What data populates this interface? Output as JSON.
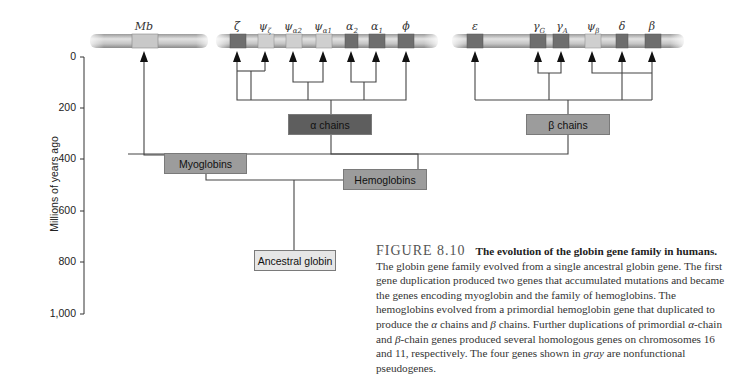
{
  "figure": {
    "number": "FIGURE 8.10",
    "title": "The evolution of the globin gene family in humans.",
    "caption_parts": [
      "The globin gene family evolved from a single ancestral globin gene. The first gene duplication produced two genes that accumulated mutations and became the genes encoding myoglobin and the family of hemoglobins. The hemoglobins evolved from a primordial hemoglobin gene that duplicated to produce the ",
      "α",
      " chains and ",
      "β",
      " chains. Further duplications of primordial ",
      "α",
      "-chain and ",
      "β",
      "-chain genes produced several homologous genes on chromosomes 16 and 11, respectively. The four genes shown in ",
      "gray",
      " are nonfunctional pseudogenes."
    ]
  },
  "axis": {
    "label": "Millions of years ago",
    "ticks": [
      "0",
      "200",
      "400",
      "600",
      "800",
      "1,000"
    ]
  },
  "genes": {
    "myoglobin_chromosome": [
      {
        "symbol": "Mb",
        "sub": ""
      }
    ],
    "alpha_chromosome": [
      {
        "symbol": "ζ",
        "sub": ""
      },
      {
        "symbol": "ψ",
        "sub": "ζ"
      },
      {
        "symbol": "ψ",
        "sub": "α2"
      },
      {
        "symbol": "ψ",
        "sub": "α1"
      },
      {
        "symbol": "α",
        "sub": "2"
      },
      {
        "symbol": "α",
        "sub": "1"
      },
      {
        "symbol": "ϕ",
        "sub": ""
      }
    ],
    "beta_chromosome": [
      {
        "symbol": "ε",
        "sub": ""
      },
      {
        "symbol": "γ",
        "sub": "G"
      },
      {
        "symbol": "γ",
        "sub": "A"
      },
      {
        "symbol": "ψ",
        "sub": "β"
      },
      {
        "symbol": "δ",
        "sub": ""
      },
      {
        "symbol": "β",
        "sub": ""
      }
    ]
  },
  "nodes": {
    "ancestral": "Ancestral globin",
    "myoglobins": "Myoglobins",
    "hemoglobins": "Hemoglobins",
    "alpha_chains": "α chains",
    "beta_chains": "β chains"
  },
  "colors": {
    "dark_node": "#5e5e5e",
    "mid_node": "#9c9c9c",
    "light_node": "#e6e6e6",
    "line": "#444444"
  }
}
